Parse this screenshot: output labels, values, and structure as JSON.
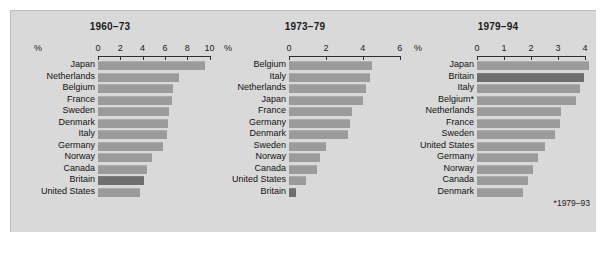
{
  "figure": {
    "background": "#d9d9d9",
    "bar_color": "#9b9b9b",
    "highlight_color": "#6e6e6e",
    "footnote": "*1979–93"
  },
  "chart_data": {
    "type": "bar",
    "title": "",
    "xlabel": "%",
    "ylabel": "",
    "orientation": "horizontal",
    "grid": false,
    "legend": "none",
    "highlight_category": "Britain",
    "panels": [
      {
        "title": "1960–73",
        "unit_label": "%",
        "xlim": [
          0,
          10
        ],
        "ticks": [
          0,
          2,
          4,
          6,
          8,
          10
        ],
        "tick_labels": [
          "0",
          "2",
          "4",
          "6",
          "8",
          "10"
        ],
        "categories": [
          "Japan",
          "Netherlands",
          "Belgium",
          "France",
          "Sweden",
          "Denmark",
          "Italy",
          "Germany",
          "Norway",
          "Canada",
          "Britain",
          "United States"
        ],
        "values": [
          9.6,
          7.3,
          6.7,
          6.6,
          6.4,
          6.3,
          6.2,
          5.8,
          4.8,
          4.4,
          4.1,
          3.8
        ]
      },
      {
        "title": "1973–79",
        "unit_label": "%",
        "xlim": [
          0,
          6
        ],
        "ticks": [
          0,
          2,
          4,
          6
        ],
        "tick_labels": [
          "0",
          "2",
          "4",
          "6"
        ],
        "categories": [
          "Belgium",
          "Italy",
          "Netherlands",
          "Japan",
          "France",
          "Germany",
          "Denmark",
          "Sweden",
          "Norway",
          "Canada",
          "United States",
          "Britain"
        ],
        "values": [
          4.5,
          4.4,
          4.2,
          4.0,
          3.4,
          3.3,
          3.2,
          2.0,
          1.7,
          1.5,
          0.9,
          0.4
        ]
      },
      {
        "title": "1979–94",
        "unit_label": "%",
        "xlim": [
          0,
          4
        ],
        "ticks": [
          0,
          1,
          2,
          3,
          4
        ],
        "tick_labels": [
          "0",
          "1",
          "2",
          "3",
          "4"
        ],
        "categories": [
          "Japan",
          "Britain",
          "Italy",
          "Belgium*",
          "Netherlands",
          "France",
          "Sweden",
          "United States",
          "Germany",
          "Norway",
          "Canada",
          "Denmark"
        ],
        "values": [
          4.15,
          3.95,
          3.8,
          3.65,
          3.1,
          3.08,
          2.9,
          2.5,
          2.27,
          2.08,
          1.9,
          1.7
        ]
      }
    ]
  }
}
